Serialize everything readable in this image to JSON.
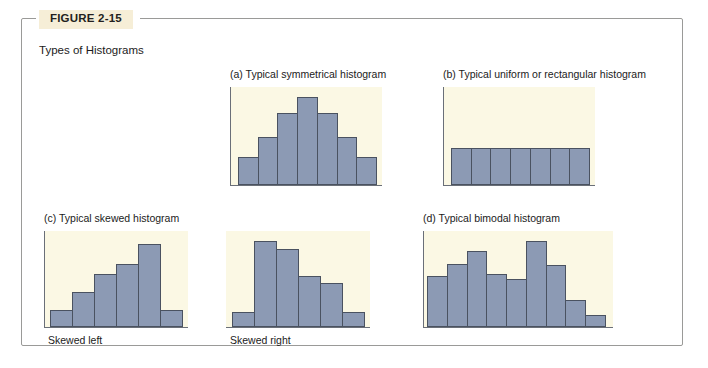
{
  "figure": {
    "tag": "FIGURE 2-15",
    "caption": "Types of Histograms"
  },
  "colors": {
    "bar_fill": "#8c9ab4",
    "bar_stroke": "#4a5260",
    "plot_background": "#fbf8e4",
    "axis": "#6a6f78",
    "frame_border": "#9a9a98",
    "tag_background": "#f6eed7",
    "text": "#1b1b1b"
  },
  "panels": [
    {
      "key": "a",
      "label": "(a)  Typical symmetrical histogram",
      "sublabel": ""
    },
    {
      "key": "b",
      "label": "(b)  Typical uniform or rectangular histogram",
      "sublabel": ""
    },
    {
      "key": "c",
      "label": "(c)  Typical skewed histogram",
      "sublabel_left": "Skewed left",
      "sublabel_right": "Skewed right"
    },
    {
      "key": "d",
      "label": "(d)  Typical bimodal histogram",
      "sublabel": ""
    }
  ],
  "chart_data": [
    {
      "id": "a-symmetrical",
      "type": "bar",
      "title": "(a)  Typical symmetrical histogram",
      "categories": [
        "1",
        "2",
        "3",
        "4",
        "5",
        "6",
        "7"
      ],
      "values": [
        30,
        52,
        78,
        95,
        78,
        52,
        30
      ],
      "ylim": [
        0,
        100
      ],
      "xlabel": "",
      "ylabel": "",
      "grid": false,
      "legend": "none"
    },
    {
      "id": "b-uniform",
      "type": "bar",
      "title": "(b)  Typical uniform or rectangular histogram",
      "categories": [
        "1",
        "2",
        "3",
        "4",
        "5",
        "6",
        "7"
      ],
      "values": [
        40,
        40,
        40,
        40,
        40,
        40,
        40
      ],
      "ylim": [
        0,
        100
      ],
      "xlabel": "",
      "ylabel": "",
      "grid": false,
      "legend": "none"
    },
    {
      "id": "c-skewed-left",
      "type": "bar",
      "title": "(c)  Typical skewed histogram",
      "subtitle": "Skewed left",
      "categories": [
        "1",
        "2",
        "3",
        "4",
        "5",
        "6"
      ],
      "values": [
        18,
        38,
        58,
        70,
        92,
        18
      ],
      "ylim": [
        0,
        100
      ],
      "xlabel": "",
      "ylabel": "",
      "grid": false,
      "legend": "none"
    },
    {
      "id": "c-skewed-right",
      "type": "bar",
      "title": "",
      "subtitle": "Skewed right",
      "categories": [
        "1",
        "2",
        "3",
        "4",
        "5",
        "6"
      ],
      "values": [
        16,
        95,
        86,
        56,
        48,
        16
      ],
      "ylim": [
        0,
        100
      ],
      "xlabel": "",
      "ylabel": "",
      "grid": false,
      "legend": "none"
    },
    {
      "id": "d-bimodal",
      "type": "bar",
      "title": "(d)  Typical bimodal histogram",
      "categories": [
        "1",
        "2",
        "3",
        "4",
        "5",
        "6",
        "7",
        "8",
        "9"
      ],
      "values": [
        56,
        70,
        84,
        58,
        53,
        95,
        68,
        30,
        13
      ],
      "ylim": [
        0,
        100
      ],
      "xlabel": "",
      "ylabel": "",
      "grid": false,
      "legend": "none"
    }
  ]
}
